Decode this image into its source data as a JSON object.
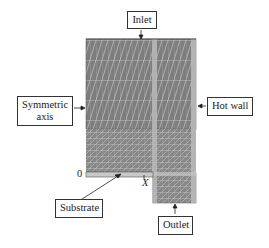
{
  "figure": {
    "type": "computational-mesh-schematic",
    "labels": {
      "inlet": "Inlet",
      "symmetric_axis_line1": "Symmetric",
      "symmetric_axis_line2": "axis",
      "hot_wall": "Hot wall",
      "substrate": "Substrate",
      "outlet": "Outlet"
    },
    "axis": {
      "origin": "0",
      "x": "X"
    },
    "colors": {
      "mesh_fill": "#7d7d7d",
      "mesh_line": "#d9d9d9",
      "strip": "#b8b8b8",
      "substrate": "#c8c8c8",
      "outline": "#333333"
    }
  }
}
